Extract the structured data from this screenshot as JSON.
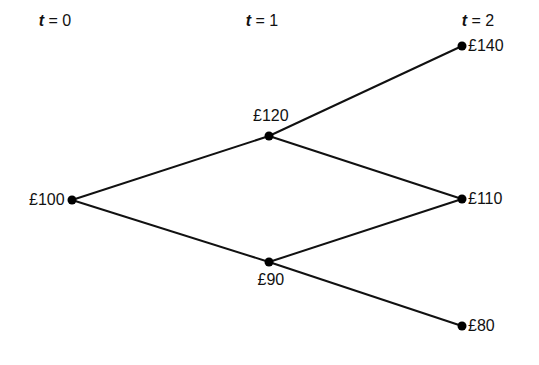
{
  "diagram": {
    "type": "binomial-tree",
    "time_headers": [
      {
        "var": "t",
        "eq": " = 0",
        "x": 55,
        "y": 12
      },
      {
        "var": "t",
        "eq": " = 1",
        "x": 262,
        "y": 12
      },
      {
        "var": "t",
        "eq": " = 2",
        "x": 478,
        "y": 12
      }
    ],
    "nodes": [
      {
        "id": "n0",
        "label": "£100",
        "x": 72,
        "y": 200,
        "label_side": "left"
      },
      {
        "id": "u1",
        "label": "£120",
        "x": 269,
        "y": 136,
        "label_side": "above"
      },
      {
        "id": "d1",
        "label": "£90",
        "x": 269,
        "y": 262,
        "label_side": "below"
      },
      {
        "id": "uu2",
        "label": "£140",
        "x": 462,
        "y": 46,
        "label_side": "right"
      },
      {
        "id": "ud2",
        "label": "£110",
        "x": 462,
        "y": 199,
        "label_side": "right"
      },
      {
        "id": "dd2",
        "label": "£80",
        "x": 462,
        "y": 326,
        "label_side": "right"
      }
    ],
    "edges": [
      [
        "n0",
        "u1"
      ],
      [
        "n0",
        "d1"
      ],
      [
        "u1",
        "uu2"
      ],
      [
        "u1",
        "ud2"
      ],
      [
        "d1",
        "ud2"
      ],
      [
        "d1",
        "dd2"
      ]
    ],
    "colors": {
      "line": "#111111",
      "node": "#000000",
      "background": "#ffffff"
    }
  }
}
